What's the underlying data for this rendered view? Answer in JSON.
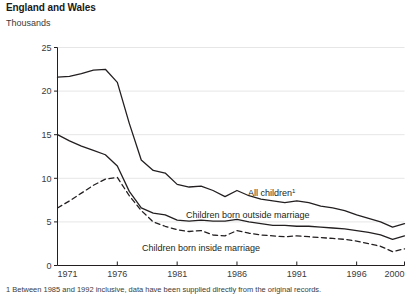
{
  "header": {
    "title": "England and Wales",
    "subtitle": "Thousands"
  },
  "footnote": "1 Between 1985 and 1992 inclusive, data have been supplied directly from the original records.",
  "series_labels": {
    "all_children": "All children",
    "all_children_sup": "1",
    "outside": "Children born outside marriage",
    "inside": "Children born inside marriage"
  },
  "chart_data": {
    "type": "line",
    "title": "England and Wales",
    "subtitle": "Thousands",
    "xlabel": "",
    "ylabel": "Thousands",
    "xlim": [
      1971,
      2000
    ],
    "ylim": [
      0,
      25
    ],
    "yticks": [
      0,
      5,
      10,
      15,
      20,
      25
    ],
    "xticks": [
      1971,
      1976,
      1981,
      1986,
      1991,
      1996,
      2000
    ],
    "grid": true,
    "legend": "inline-labels",
    "x": [
      1971,
      1972,
      1973,
      1974,
      1975,
      1976,
      1977,
      1978,
      1979,
      1980,
      1981,
      1982,
      1983,
      1984,
      1985,
      1986,
      1987,
      1988,
      1989,
      1990,
      1991,
      1992,
      1993,
      1994,
      1995,
      1996,
      1997,
      1998,
      1999,
      2000
    ],
    "series": [
      {
        "name": "All children",
        "style": "solid",
        "color": "#231f20",
        "values": [
          21.6,
          21.7,
          22.0,
          22.4,
          22.5,
          21.0,
          16.3,
          12.1,
          10.9,
          10.6,
          9.3,
          9.0,
          9.1,
          8.6,
          7.9,
          8.6,
          8.0,
          7.6,
          7.4,
          7.2,
          7.4,
          7.2,
          6.8,
          6.6,
          6.3,
          5.8,
          5.4,
          5.0,
          4.4,
          4.8
        ]
      },
      {
        "name": "Children born outside marriage",
        "style": "solid",
        "color": "#231f20",
        "values": [
          15.0,
          14.3,
          13.7,
          13.2,
          12.7,
          11.4,
          8.5,
          6.6,
          6.0,
          5.8,
          5.2,
          5.1,
          5.2,
          5.1,
          5.1,
          5.3,
          5.0,
          4.8,
          4.6,
          4.6,
          4.5,
          4.5,
          4.4,
          4.3,
          4.2,
          4.0,
          3.8,
          3.5,
          3.0,
          3.4
        ]
      },
      {
        "name": "Children born inside marriage",
        "style": "dashed",
        "color": "#231f20",
        "values": [
          6.6,
          7.4,
          8.3,
          9.2,
          9.9,
          10.1,
          8.0,
          6.3,
          5.0,
          4.5,
          4.1,
          3.9,
          4.0,
          3.5,
          3.4,
          4.0,
          3.7,
          3.5,
          3.4,
          3.3,
          3.4,
          3.3,
          3.2,
          3.1,
          3.0,
          2.8,
          2.5,
          2.2,
          1.6,
          1.9
        ]
      }
    ]
  }
}
